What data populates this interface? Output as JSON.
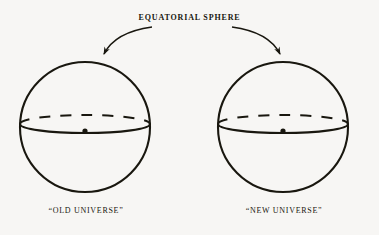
{
  "figure": {
    "title": "EQUATORIAL SPHERE",
    "background_color": "#f7f6f4",
    "ink_color": "#19170f",
    "width": 379,
    "height": 235
  },
  "annotation": {
    "label": "EQUATORIAL SPHERE",
    "arrows": [
      {
        "name": "arrow-to-old-universe",
        "target": "old-universe-sphere",
        "points_to": "top of left sphere"
      },
      {
        "name": "arrow-to-new-universe",
        "target": "new-universe-sphere",
        "points_to": "top of right sphere"
      }
    ]
  },
  "spheres": [
    {
      "id": "old-universe",
      "label": "“OLD UNIVERSE”",
      "center_x": 85,
      "center_y": 127,
      "radius": 65,
      "equator_minor_axis": 9,
      "equator_offset_y": -3,
      "center_dot": {
        "x": 85,
        "y": 131,
        "radius": 2.6
      },
      "equator_back_style": "dashed",
      "equator_front_style": "solid"
    },
    {
      "id": "new-universe",
      "label": "“NEW UNIVERSE”",
      "center_x": 283,
      "center_y": 127,
      "radius": 65,
      "equator_minor_axis": 9,
      "equator_offset_y": -3,
      "center_dot": {
        "x": 283,
        "y": 131,
        "radius": 2.6
      },
      "equator_back_style": "dashed",
      "equator_front_style": "solid"
    }
  ]
}
